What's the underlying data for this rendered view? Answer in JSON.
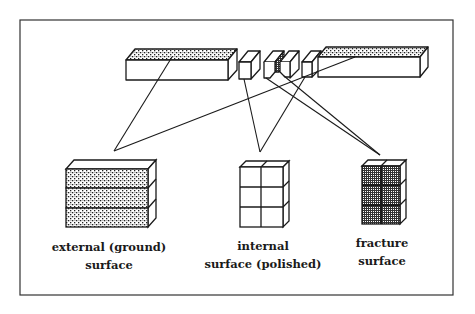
{
  "diagram": {
    "type": "specimen-surface-schematic",
    "source_bar": {
      "description": "Long bar specimen cut into pieces; top faces of end bars textured (ground), small middle cubes sectioned",
      "pieces": [
        "left-bar",
        "cube-1",
        "cube-2",
        "cube-3",
        "cube-4",
        "right-bar"
      ]
    },
    "targets": [
      {
        "id": "external",
        "line1": "external (ground)",
        "line2": "surface",
        "pattern": "stipple",
        "rows": 3,
        "cols": 1
      },
      {
        "id": "internal",
        "line1": "internal",
        "line2": "surface (polished)",
        "pattern": "plain",
        "rows": 3,
        "cols": 2
      },
      {
        "id": "fracture",
        "line1": "fracture",
        "line2": "surface",
        "pattern": "crosshatch",
        "rows": 3,
        "cols": 2
      }
    ],
    "colors": {
      "ink": "#1a1a1a",
      "paper": "#ffffff",
      "frame": "#333333"
    }
  }
}
